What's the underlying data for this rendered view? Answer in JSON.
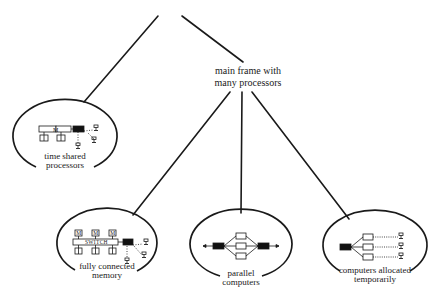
{
  "diagram": {
    "type": "tree",
    "colors": {
      "ink": "#1a1a1a",
      "fill": "#ffffff",
      "dark_box": "#111111"
    },
    "intermediate_node": {
      "label_lines": [
        "main frame with",
        "many processors"
      ]
    },
    "leaf_nodes": [
      {
        "id": "time-shared",
        "label_lines": [
          "time shared",
          "processors"
        ],
        "inner_labels": [
          "M"
        ],
        "parent": "root"
      },
      {
        "id": "fully-connected",
        "label_lines": [
          "fully connected",
          "memory"
        ],
        "inner_labels": [
          "M",
          "M",
          "M",
          "SWITCH",
          "P",
          "P",
          "P"
        ],
        "parent": "main-frame"
      },
      {
        "id": "parallel",
        "label_lines": [
          "parallel",
          "computers"
        ],
        "inner_labels": [],
        "parent": "main-frame"
      },
      {
        "id": "allocated",
        "label_lines": [
          "computers allocated",
          "temporarily"
        ],
        "inner_labels": [],
        "parent": "main-frame"
      }
    ],
    "edges": [
      {
        "from": "root",
        "to": "time-shared"
      },
      {
        "from": "root",
        "to": "main-frame"
      },
      {
        "from": "main-frame",
        "to": "fully-connected"
      },
      {
        "from": "main-frame",
        "to": "parallel"
      },
      {
        "from": "main-frame",
        "to": "allocated"
      }
    ]
  }
}
